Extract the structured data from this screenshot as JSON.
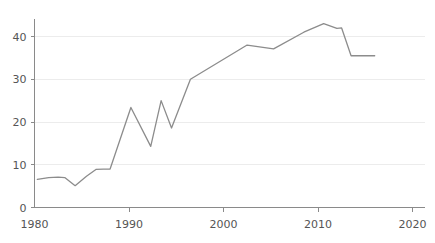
{
  "chart_data": {
    "type": "line",
    "title": "",
    "subtitle": "",
    "xlabel": "",
    "ylabel": "",
    "xlim": [
      1980,
      2020
    ],
    "ylim": [
      0,
      45
    ],
    "grid": "horizontal",
    "legend": "none",
    "yticks": [
      0,
      10,
      20,
      30,
      40
    ],
    "ytick_labels": [
      "0",
      "10",
      "20",
      "30",
      "40"
    ],
    "xticks": [
      1980,
      1990,
      2000,
      2010,
      2020
    ],
    "xtick_labels": [
      "1980",
      "1990",
      "2000",
      "2010",
      "2020"
    ],
    "series": [
      {
        "name": "series-1",
        "color": "#8c8c8c",
        "x": [
          1980.3,
          1981.5,
          1982.5,
          1983.2,
          1984.3,
          1985.5,
          1986.5,
          1987.3,
          1988.0,
          1990.2,
          1992.3,
          1993.4,
          1994.5,
          1996.5,
          2002.5,
          2005.3,
          2008.5,
          2010.6,
          2012.0,
          2012.5,
          2013.5,
          2016.0
        ],
        "y": [
          6.6,
          7.0,
          7.1,
          7.0,
          5.1,
          7.3,
          8.9,
          9.0,
          9.0,
          23.4,
          14.3,
          25.0,
          18.6,
          30.0,
          38.0,
          37.1,
          41.0,
          43.0,
          41.9,
          42.0,
          35.5,
          35.5
        ]
      }
    ]
  },
  "axis": {
    "y_label_color": "#555555",
    "x_label_color": "#555555",
    "axis_color": "#8a8a8a",
    "grid_color": "#ececec"
  }
}
